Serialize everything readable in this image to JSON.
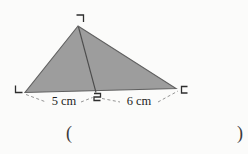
{
  "page": {
    "background": "#fbfbfa"
  },
  "figure": {
    "vertex_labels": {
      "top": "ㄱ",
      "bottom_left": "ㄴ",
      "bottom_right": "ㄷ",
      "base_point": "ㄹ"
    },
    "measurements": {
      "left_segment": "5 cm",
      "right_segment": "6 cm"
    },
    "colors": {
      "fill": "#9d9d9d",
      "outline": "#606060",
      "cevian": "#4c4c4c",
      "dashes": "#949494",
      "labels": "#2e2e2e",
      "text": "#1e1e1e",
      "parens": "#3a3a3a"
    }
  },
  "answer_blank": {
    "open": "(",
    "close": ")"
  }
}
